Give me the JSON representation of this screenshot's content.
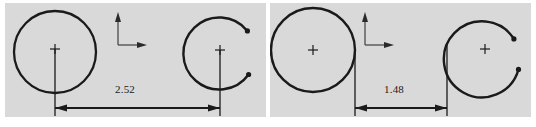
{
  "figure": {
    "type": "engineering-drawing",
    "background_color": "#ffffff",
    "panel_color": "#d9d9d9",
    "ink_color": "#1a1a1a",
    "panel_count": 2,
    "panels": [
      {
        "id": "panel-left",
        "x": 5,
        "y": 3,
        "width": 261,
        "height": 114,
        "dimension_value": "2.52",
        "axis_icon": "coordinate-axes-icon",
        "left_shape": {
          "kind": "full-circle",
          "cx": 50,
          "cy": 49,
          "r": 41,
          "center_mark": "plus"
        },
        "right_shape": {
          "kind": "open-arc",
          "cx": 215,
          "cy": 52,
          "r": 36,
          "center_mark": "plus",
          "endpoint_dots": 2
        },
        "extension_lines": [
          {
            "x": 50,
            "y_top": 46,
            "y_bottom": 113
          },
          {
            "x": 215,
            "y_top": 48,
            "y_bottom": 113
          }
        ],
        "dim_line_y": 108
      },
      {
        "id": "panel-right",
        "x": 270,
        "y": 3,
        "width": 261,
        "height": 114,
        "dimension_value": "1.48",
        "axis_icon": "coordinate-axes-icon",
        "left_shape": {
          "kind": "full-circle",
          "cx": 43,
          "cy": 47,
          "r": 42,
          "center_mark": "plus"
        },
        "right_shape": {
          "kind": "open-arc",
          "cx": 215,
          "cy": 50,
          "r": 38,
          "center_mark": "plus",
          "endpoint_dots": 2
        },
        "extension_lines": [
          {
            "x": 85,
            "y_top": 47,
            "y_bottom": 113
          },
          {
            "x": 177,
            "y_top": 42,
            "y_bottom": 113
          }
        ],
        "dim_line_y": 108
      }
    ]
  },
  "labels": {
    "left_dimension": "2.52",
    "right_dimension": "1.48"
  }
}
